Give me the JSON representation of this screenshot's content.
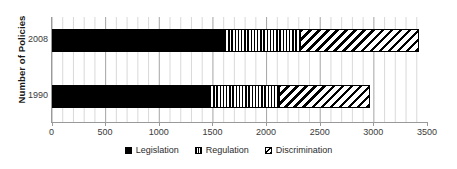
{
  "chart_data": {
    "type": "bar",
    "orientation": "horizontal",
    "stacked": true,
    "title": "",
    "xlabel": "",
    "ylabel": "Number of Policies",
    "categories": [
      "2008",
      "1990"
    ],
    "xlim": [
      0,
      3500
    ],
    "xticks": [
      0,
      500,
      1000,
      1500,
      2000,
      2500,
      3000,
      3500
    ],
    "xtick_labels": [
      "0",
      "500",
      "1000",
      "1500",
      "2000",
      "2500",
      "3000",
      "3500"
    ],
    "grid": "vertical-minor-100",
    "legend_position": "bottom-center",
    "series": [
      {
        "name": "Legislation",
        "pattern": "solid-black",
        "color": "#000000",
        "values": [
          1610,
          1470
        ]
      },
      {
        "name": "Regulation",
        "pattern": "vertical-stripes",
        "color": "#000000",
        "values": [
          710,
          650
        ]
      },
      {
        "name": "Discrimination",
        "pattern": "diagonal-stripes",
        "color": "#000000",
        "values": [
          1110,
          850
        ]
      }
    ],
    "totals": [
      3430,
      2970
    ],
    "legend": [
      "Legislation",
      "Regulation",
      "Discrimination"
    ]
  },
  "axis": {
    "y_title": "Number of Policies"
  }
}
